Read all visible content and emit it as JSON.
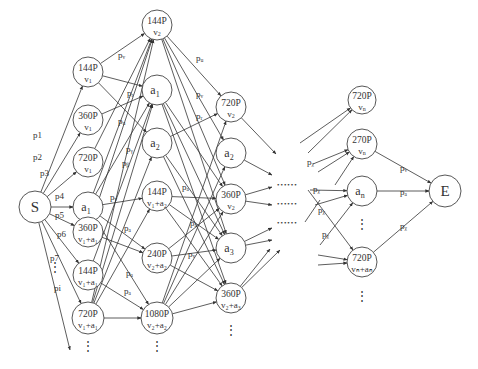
{
  "diagram": {
    "title": "",
    "source": {
      "id": "S",
      "label": "S",
      "x": 35,
      "y": 207,
      "r": 16
    },
    "sink": {
      "id": "E",
      "label": "E",
      "x": 445,
      "y": 191,
      "r": 16
    },
    "nodes": [
      {
        "id": "c1_144v1",
        "line1": "144P",
        "line2": "v",
        "sub2": "1",
        "x": 88,
        "y": 72,
        "r": 15
      },
      {
        "id": "c1_360v1",
        "line1": "360P",
        "line2": "v",
        "sub2": "1",
        "x": 88,
        "y": 120,
        "r": 15
      },
      {
        "id": "c1_720v1",
        "line1": "720P",
        "line2": "v",
        "sub2": "1",
        "x": 88,
        "y": 162,
        "r": 15
      },
      {
        "id": "c1_a1",
        "line1": "",
        "line2": "a",
        "sub2": "1",
        "x": 88,
        "y": 207,
        "r": 15,
        "single": true
      },
      {
        "id": "c1_360v1a1",
        "line1": "360P",
        "line2": "v₁+a₁",
        "x": 88,
        "y": 232,
        "r": 15
      },
      {
        "id": "c1_144v1a1",
        "line1": "144P",
        "line2": "v₁+a₁",
        "x": 88,
        "y": 275,
        "r": 15
      },
      {
        "id": "c1_720v1a1",
        "line1": "720P",
        "line2": "v₁+a₁",
        "x": 88,
        "y": 318,
        "r": 16
      },
      {
        "id": "c2_144v2",
        "line1": "144P",
        "line2": "v",
        "sub2": "2",
        "x": 157,
        "y": 25,
        "r": 15
      },
      {
        "id": "c2_a1",
        "line1": "",
        "line2": "a",
        "sub2": "1",
        "x": 157,
        "y": 90,
        "r": 15,
        "single": true
      },
      {
        "id": "c2_a2",
        "line1": "",
        "line2": "a",
        "sub2": "2",
        "x": 157,
        "y": 143,
        "r": 15,
        "single": true
      },
      {
        "id": "c2_144v1a2",
        "line1": "144P",
        "line2": "v₁+a₂",
        "x": 157,
        "y": 196,
        "r": 15
      },
      {
        "id": "c2_240v2a2",
        "line1": "240P",
        "line2": "v₂+a₂",
        "x": 157,
        "y": 258,
        "r": 15
      },
      {
        "id": "c2_1080v2a2",
        "line1": "1080P",
        "line2": "v₂+a₂",
        "x": 157,
        "y": 318,
        "r": 16
      },
      {
        "id": "c3_720v2",
        "line1": "720P",
        "line2": "v",
        "sub2": "2",
        "x": 231,
        "y": 107,
        "r": 15
      },
      {
        "id": "c3_a2",
        "line1": "",
        "line2": "a",
        "sub2": "2",
        "x": 231,
        "y": 153,
        "r": 15,
        "single": true
      },
      {
        "id": "c3_360v2",
        "line1": "360P",
        "line2": "v",
        "sub2": "2",
        "x": 231,
        "y": 199,
        "r": 15
      },
      {
        "id": "c3_a3",
        "line1": "",
        "line2": "a",
        "sub2": "3",
        "x": 231,
        "y": 248,
        "r": 15,
        "single": true
      },
      {
        "id": "c3_360v2a3",
        "line1": "360P",
        "line2": "v₂+a₃",
        "x": 231,
        "y": 298,
        "r": 15
      },
      {
        "id": "cn_720vn",
        "line1": "720P",
        "line2": "v",
        "sub2": "n",
        "x": 362,
        "y": 100,
        "r": 14
      },
      {
        "id": "cn_270vn",
        "line1": "270P",
        "line2": "v",
        "sub2": "n",
        "x": 362,
        "y": 144,
        "r": 15
      },
      {
        "id": "cn_an",
        "line1": "",
        "line2": "a",
        "sub2": "n",
        "x": 362,
        "y": 191,
        "r": 15,
        "single": true
      },
      {
        "id": "cn_720vnan",
        "line1": "720P",
        "line2": "vₙ+aₙ",
        "x": 362,
        "y": 262,
        "r": 15
      }
    ],
    "edge_labels": [
      {
        "text": "p1",
        "x": 33,
        "y": 138
      },
      {
        "text": "p2",
        "x": 33,
        "y": 160
      },
      {
        "text": "p3",
        "x": 40,
        "y": 176
      },
      {
        "text": "p4",
        "x": 55,
        "y": 199
      },
      {
        "text": "p5",
        "x": 55,
        "y": 218
      },
      {
        "text": "p6",
        "x": 57,
        "y": 237
      },
      {
        "text": "p7",
        "x": 50,
        "y": 261
      },
      {
        "text": "pi",
        "x": 54,
        "y": 291
      },
      {
        "text": "pᵥ",
        "x": 118,
        "y": 58
      },
      {
        "text": "pᵣ",
        "x": 127,
        "y": 96
      },
      {
        "text": "pᵤ",
        "x": 118,
        "y": 124
      },
      {
        "text": "pᵧ",
        "x": 126,
        "y": 152
      },
      {
        "text": "pᵦ",
        "x": 122,
        "y": 166
      },
      {
        "text": "pᵥ",
        "x": 110,
        "y": 200
      },
      {
        "text": "pₐ",
        "x": 124,
        "y": 231
      },
      {
        "text": "pₐ",
        "x": 126,
        "y": 276
      },
      {
        "text": "pₐ",
        "x": 124,
        "y": 294
      },
      {
        "text": "pᵤ",
        "x": 196,
        "y": 61
      },
      {
        "text": "pᵥ",
        "x": 196,
        "y": 97
      },
      {
        "text": "pᵣ",
        "x": 196,
        "y": 119
      },
      {
        "text": "pₐ",
        "x": 182,
        "y": 190
      },
      {
        "text": "pₐ",
        "x": 190,
        "y": 226
      },
      {
        "text": "pᵥ",
        "x": 188,
        "y": 257
      },
      {
        "text": "pᵪ",
        "x": 307,
        "y": 165
      },
      {
        "text": "pᵪ",
        "x": 313,
        "y": 192
      },
      {
        "text": "pᵪ",
        "x": 318,
        "y": 213
      },
      {
        "text": "pᵪ",
        "x": 322,
        "y": 237
      },
      {
        "text": "pᵥ",
        "x": 400,
        "y": 171
      },
      {
        "text": "pₐ",
        "x": 400,
        "y": 195
      },
      {
        "text": "pᵪ",
        "x": 400,
        "y": 229
      }
    ],
    "ellipsis_rows": [
      {
        "text": "••••••",
        "x": 277,
        "y": 187
      },
      {
        "text": "••••••",
        "x": 277,
        "y": 206
      },
      {
        "text": "••••••",
        "x": 277,
        "y": 225
      }
    ],
    "vertical_ellipses": [
      {
        "text": "⋮",
        "x": 55,
        "y": 271
      },
      {
        "text": "⋮",
        "x": 88,
        "y": 350
      },
      {
        "text": "⋮",
        "x": 157,
        "y": 350
      },
      {
        "text": "⋮",
        "x": 231,
        "y": 334
      },
      {
        "text": "⋮",
        "x": 362,
        "y": 228
      },
      {
        "text": "⋮",
        "x": 362,
        "y": 300
      }
    ]
  }
}
